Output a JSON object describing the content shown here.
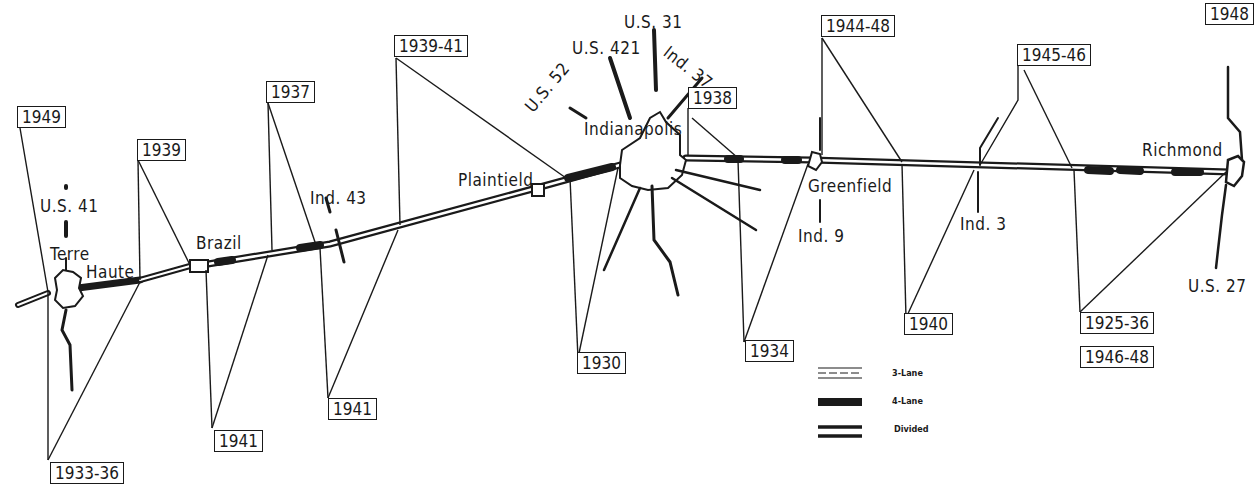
{
  "map": {
    "title": "U.S. 40 highway improvement dates across Indiana",
    "cities": [
      {
        "name": "Terre Haute",
        "line1": "Terre",
        "line2": "Haute"
      },
      {
        "name": "Brazil"
      },
      {
        "name": "Plainfield",
        "display": "Plaintield"
      },
      {
        "name": "Indianapolis"
      },
      {
        "name": "Greenfield"
      },
      {
        "name": "Richmond"
      }
    ],
    "routes": {
      "us41": "U.S. 41",
      "ind43": "Ind. 43",
      "us52": "U.S. 52",
      "us421": "U.S. 421",
      "us31": "U.S. 31",
      "ind37": "Ind. 37",
      "ind9": "Ind. 9",
      "ind3": "Ind. 3",
      "us27": "U.S. 27"
    },
    "year_labels": {
      "y1949": "1949",
      "y1933_36": "1933-36",
      "y1939": "1939",
      "y1941_brazil": "1941",
      "y1937": "1937",
      "y1941_ind43": "1941",
      "y1939_41": "1939-41",
      "y1930": "1930",
      "y1938": "1938",
      "y1934": "1934",
      "y1944_48": "1944-48",
      "y1940": "1940",
      "y1945_46": "1945-46",
      "y1925_36": "1925-36",
      "y1946_48": "1946-48",
      "y1948": "1948"
    },
    "legend": [
      {
        "symbol": "three-lane",
        "label": "3-Lane"
      },
      {
        "symbol": "four-lane",
        "label": "4-Lane"
      },
      {
        "symbol": "divided",
        "label": "Divided"
      }
    ]
  }
}
